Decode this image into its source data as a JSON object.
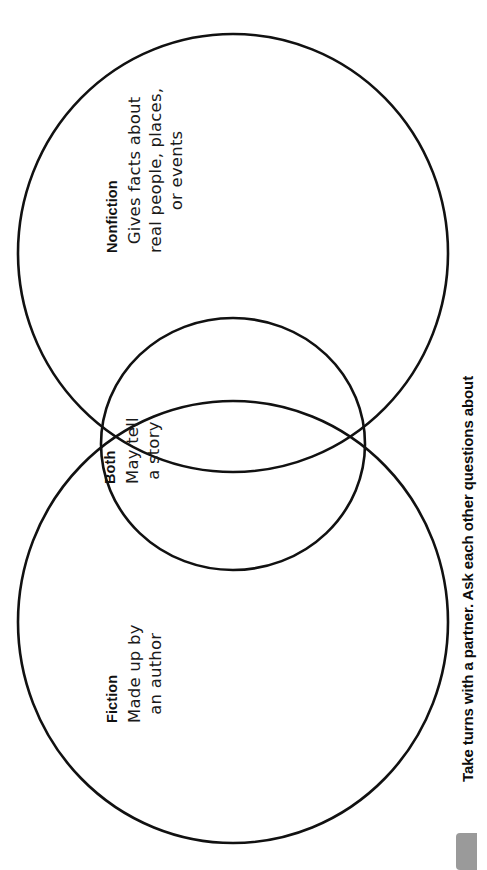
{
  "page": {
    "type": "venn-diagram-worksheet",
    "orientation": "rotated-90-counterclockwise",
    "background_color": "#ffffff",
    "stroke_color": "#111111"
  },
  "diagram": {
    "kind": "two-circle-venn",
    "regions": [
      {
        "id": "nonfiction",
        "title": "Nonfiction",
        "lines": [
          "Gives facts about",
          "real people, places,",
          "or events"
        ]
      },
      {
        "id": "both",
        "title": "Both",
        "lines": [
          "May tell",
          "a story"
        ]
      },
      {
        "id": "fiction",
        "title": "Fiction",
        "lines": [
          "Made up by",
          "an author"
        ]
      }
    ]
  },
  "caption": {
    "text": "Take turns with a partner. Ask each other questions about"
  },
  "tab": {
    "color": "#9a9a9a"
  }
}
